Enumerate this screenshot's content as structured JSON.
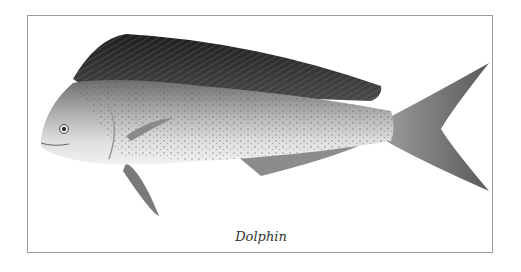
{
  "figure": {
    "caption": "Dolphin",
    "border_color": "#9a9a9a"
  }
}
